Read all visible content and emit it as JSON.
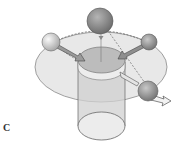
{
  "figure": {
    "panel_label": "C",
    "colors": {
      "background": "#ffffff",
      "plane": "#e6e6e6",
      "plane_stroke": "#8a8a8a",
      "cylinder": "#d2d2d2",
      "disk_top": "#bdbdbd",
      "disk_side": "#ececec",
      "sphere_dark": "#8c8c8c",
      "sphere_light": "#dcdcdc",
      "arrow": "#9a9a9a"
    },
    "spheres": [
      {
        "name": "top",
        "cx": 100,
        "cy": 21,
        "r": 13
      },
      {
        "name": "left",
        "cx": 51,
        "cy": 42,
        "r": 9
      },
      {
        "name": "right",
        "cx": 149,
        "cy": 42,
        "r": 8
      },
      {
        "name": "bottom-right",
        "cx": 148,
        "cy": 91,
        "r": 10
      }
    ]
  }
}
